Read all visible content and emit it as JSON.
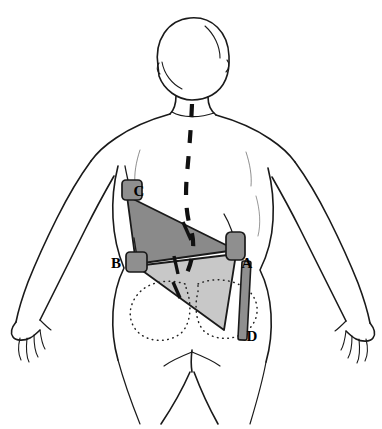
{
  "figure": {
    "view": "posterior (back) view of human upper body",
    "background_color": "#ffffff",
    "outline_color": "#1a1a1a",
    "width": 382,
    "height": 429
  },
  "colors": {
    "upper_triangle_fill": "#8a8a8a",
    "lower_triangle_fill": "#c8c8c8",
    "marker_fill": "#8f8f8f",
    "marker_stroke": "#1a1a1a",
    "bar_fill": "#8f8f8f",
    "spine_dash": "#111111",
    "dotted_outline": "#222222",
    "body_outline": "#1a1a1a"
  },
  "markers": [
    {
      "id": "A",
      "label": "A",
      "shape": "rounded-rectangle",
      "x": 231,
      "y": 248,
      "width": 18,
      "height": 26,
      "label_x": 245,
      "label_y": 268,
      "description": "right lateral marker at iliac/flank level"
    },
    {
      "id": "B",
      "label": "B",
      "shape": "rounded-rectangle",
      "x": 130,
      "y": 261,
      "width": 20,
      "height": 19,
      "label_x": 116,
      "label_y": 268,
      "description": "left lateral marker at waist level"
    },
    {
      "id": "C",
      "label": "C",
      "shape": "rounded-rectangle",
      "x": 122,
      "y": 190,
      "width": 20,
      "height": 20,
      "label_x": 139,
      "label_y": 194,
      "description": "left upper marker below scapula"
    },
    {
      "id": "D",
      "label": "D",
      "shape": "long-vertical-bar",
      "x": 240,
      "y": 300,
      "width": 9,
      "height": 75,
      "label_x": 249,
      "label_y": 340,
      "description": "vertical reference bar descending from marker A"
    }
  ],
  "triangles": [
    {
      "name": "upper-triangle",
      "fill": "#8a8a8a",
      "vertices": [
        [
          127,
          196
        ],
        [
          136,
          264
        ],
        [
          236,
          250
        ]
      ],
      "vertex_labels": [
        "C",
        "B",
        "A"
      ]
    },
    {
      "name": "lower-triangle",
      "fill": "#c8c8c8",
      "vertices": [
        [
          136,
          266
        ],
        [
          236,
          254
        ],
        [
          224,
          330
        ]
      ],
      "vertex_labels": [
        "B",
        "A",
        "D-top"
      ]
    }
  ],
  "annotations": {
    "spine_line_style": "dashed",
    "pelvis_outline_style": "dotted",
    "tick_marks": 3
  },
  "label_list": [
    "A",
    "B",
    "C",
    "D"
  ]
}
